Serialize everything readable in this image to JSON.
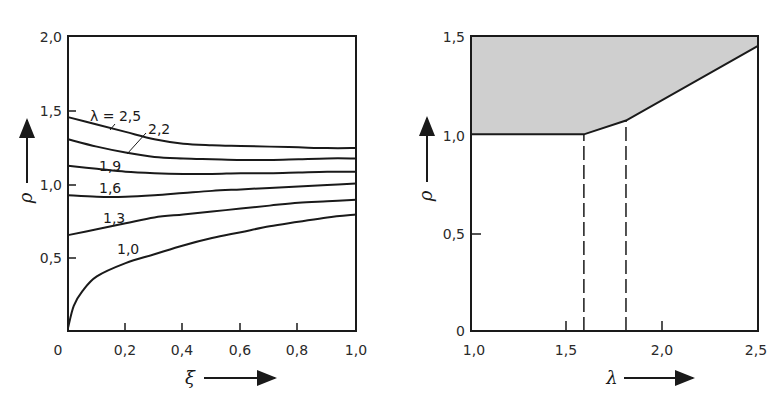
{
  "chart_data": [
    {
      "type": "line",
      "title": "",
      "xlabel": "ξ",
      "ylabel": "ρ",
      "xlim": [
        0,
        1.0
      ],
      "ylim": [
        0,
        2.0
      ],
      "xticks": [
        "0",
        "0,2",
        "0,4",
        "0,6",
        "0,8",
        "1,0"
      ],
      "yticks": [
        "0,5",
        "1,0",
        "1,5",
        "2,0"
      ],
      "grid": false,
      "legend": "inline curve labels",
      "series": [
        {
          "name": "λ = 2,5",
          "label": "λ = 2,5",
          "x": [
            0,
            0.1,
            0.2,
            0.3,
            0.4,
            0.5,
            0.6,
            0.7,
            0.8,
            0.9,
            1.0
          ],
          "values": [
            1.45,
            1.4,
            1.35,
            1.3,
            1.27,
            1.26,
            1.255,
            1.25,
            1.245,
            1.24,
            1.24
          ]
        },
        {
          "name": "λ = 2,2",
          "label": "2,2",
          "x": [
            0,
            0.1,
            0.2,
            0.3,
            0.4,
            0.5,
            0.6,
            0.7,
            0.8,
            0.9,
            1.0
          ],
          "values": [
            1.3,
            1.25,
            1.21,
            1.18,
            1.17,
            1.165,
            1.16,
            1.16,
            1.165,
            1.17,
            1.17
          ]
        },
        {
          "name": "λ = 1,9",
          "label": "1,9",
          "x": [
            0,
            0.1,
            0.2,
            0.3,
            0.4,
            0.5,
            0.6,
            0.7,
            0.8,
            0.9,
            1.0
          ],
          "values": [
            1.12,
            1.1,
            1.08,
            1.07,
            1.065,
            1.065,
            1.07,
            1.07,
            1.075,
            1.08,
            1.08
          ]
        },
        {
          "name": "λ = 1,6",
          "label": "1,6",
          "x": [
            0,
            0.1,
            0.2,
            0.3,
            0.4,
            0.5,
            0.6,
            0.7,
            0.8,
            0.9,
            1.0
          ],
          "values": [
            0.92,
            0.91,
            0.91,
            0.92,
            0.935,
            0.95,
            0.96,
            0.97,
            0.98,
            0.99,
            1.0
          ]
        },
        {
          "name": "λ = 1,3",
          "label": "1,3",
          "x": [
            0,
            0.1,
            0.2,
            0.3,
            0.4,
            0.5,
            0.6,
            0.7,
            0.8,
            0.9,
            1.0
          ],
          "values": [
            0.65,
            0.69,
            0.73,
            0.77,
            0.79,
            0.81,
            0.83,
            0.85,
            0.87,
            0.88,
            0.89
          ]
        },
        {
          "name": "λ = 1,0",
          "label": "1,0",
          "x": [
            0,
            0.02,
            0.05,
            0.1,
            0.2,
            0.3,
            0.4,
            0.5,
            0.6,
            0.7,
            0.8,
            0.9,
            1.0
          ],
          "values": [
            0.02,
            0.17,
            0.27,
            0.37,
            0.46,
            0.52,
            0.58,
            0.63,
            0.67,
            0.71,
            0.74,
            0.77,
            0.79
          ]
        }
      ]
    },
    {
      "type": "area",
      "title": "",
      "xlabel": "λ",
      "ylabel": "ρ",
      "xlim": [
        1.0,
        2.5
      ],
      "ylim": [
        0,
        1.5
      ],
      "xticks": [
        "1,0",
        "1,5",
        "2,0",
        "2,5"
      ],
      "yticks": [
        "0",
        "0,5",
        "1,0",
        "1,5"
      ],
      "grid": false,
      "legend": "none",
      "series": [
        {
          "name": "boundary (shaded above)",
          "x": [
            1.0,
            1.59,
            1.81,
            2.5
          ],
          "values": [
            1.0,
            1.0,
            1.07,
            1.45
          ]
        }
      ],
      "annotations": [
        {
          "type": "dashed-vertical",
          "x": 1.59,
          "from": 0,
          "to": 1.0
        },
        {
          "type": "dashed-vertical",
          "x": 1.81,
          "from": 0,
          "to": 1.07
        }
      ],
      "shaded_region": "area above boundary up to ρ = 1,5",
      "fill_color": "#cfcfcf"
    }
  ],
  "left": {
    "xlabel": "ξ",
    "ylabel": "ρ",
    "xticks": [
      "0",
      "0,2",
      "0,4",
      "0,6",
      "0,8",
      "1,0"
    ],
    "yticks": [
      "0,5",
      "1,0",
      "1,5",
      "2,0"
    ],
    "curve_labels": [
      "λ = 2,5",
      "2,2",
      "1,9",
      "1,6",
      "1,3",
      "1,0"
    ]
  },
  "right": {
    "xlabel": "λ",
    "ylabel": "ρ",
    "xticks": [
      "1,0",
      "1,5",
      "2,0",
      "2,5"
    ],
    "yticks": [
      "0",
      "0,5",
      "1,0",
      "1,5"
    ]
  },
  "colors": {
    "ink": "#1a1a1a",
    "shade": "#cfcfcf",
    "background": "#ffffff"
  }
}
